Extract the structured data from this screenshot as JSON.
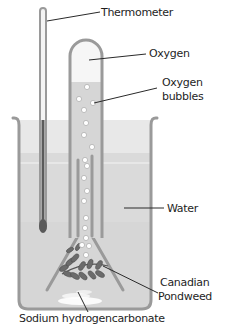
{
  "diagram": {
    "type": "labelled apparatus diagram",
    "labels": {
      "thermometer": "Thermometer",
      "oxygen": "Oxygen",
      "oxygen_bubbles_line1": "Oxygen",
      "oxygen_bubbles_line2": "bubbles",
      "water": "Water",
      "pondweed_line1": "Canadian",
      "pondweed_line2": "Pondweed",
      "sodium": "Sodium hydrogencarbonate"
    },
    "colors": {
      "glass": "#9a9a9a",
      "water_upper": "#e6e6e6",
      "water_lower": "#d8d8d8",
      "thermometer_liquid": "#5a5a5a",
      "pondweed": "#6b6b6b",
      "bubble": "#ffffff",
      "leader_line": "#2a2a2a"
    }
  }
}
